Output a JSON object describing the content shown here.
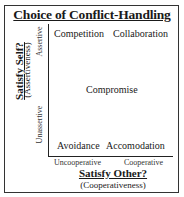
{
  "title": "Choice of Conflict-Handling",
  "quadrants": {
    "top_left": "Competition",
    "top_right": "Collaboration",
    "center": "Compromise",
    "bottom_left": "Avoidance",
    "bottom_right": "Accomodation"
  },
  "y_axis": {
    "label": "Satisfy Self?",
    "sublabel": "(Assertiveness)",
    "ticks": [
      "Assertive",
      "Unassertive"
    ]
  },
  "x_axis": {
    "label": "Satisfy Other?",
    "sublabel": "(Cooperativeness)",
    "ticks": [
      "Uncooperative",
      "Cooperative"
    ]
  }
}
